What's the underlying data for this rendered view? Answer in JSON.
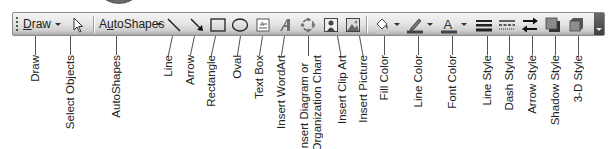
{
  "toolbar": {
    "draw_menu": {
      "label": "Draw",
      "accel": "D",
      "rest": "raw"
    },
    "autoshapes_menu": {
      "label": "AutoShapes",
      "pre": "A",
      "accel": "u",
      "rest": "toShapes"
    },
    "buttons": [
      {
        "id": "select-objects",
        "icon": "pointer-icon"
      },
      {
        "id": "line",
        "icon": "line-icon"
      },
      {
        "id": "arrow",
        "icon": "arrow-icon"
      },
      {
        "id": "rectangle",
        "icon": "rectangle-icon"
      },
      {
        "id": "oval",
        "icon": "oval-icon"
      },
      {
        "id": "text-box",
        "icon": "text-box-icon"
      },
      {
        "id": "insert-wordart",
        "icon": "wordart-icon"
      },
      {
        "id": "insert-diagram",
        "icon": "diagram-icon"
      },
      {
        "id": "insert-clip-art",
        "icon": "clip-art-icon"
      },
      {
        "id": "insert-picture",
        "icon": "picture-icon"
      },
      {
        "id": "fill-color",
        "icon": "paint-bucket-icon",
        "swatch": "#c8c8c8"
      },
      {
        "id": "line-color",
        "icon": "pen-icon",
        "swatch": "#444444"
      },
      {
        "id": "font-color",
        "icon": "font-color-icon",
        "swatch": "#444444"
      },
      {
        "id": "line-style",
        "icon": "line-style-icon"
      },
      {
        "id": "dash-style",
        "icon": "dash-style-icon"
      },
      {
        "id": "arrow-style",
        "icon": "arrow-style-icon"
      },
      {
        "id": "shadow-style",
        "icon": "shadow-style-icon"
      },
      {
        "id": "3d-style",
        "icon": "3d-style-icon"
      }
    ]
  },
  "callouts": [
    {
      "text": "Draw"
    },
    {
      "text": "Select Objects"
    },
    {
      "text": "AutoShapes"
    },
    {
      "text": "Line"
    },
    {
      "text": "Arrow"
    },
    {
      "text": "Rectangle"
    },
    {
      "text": "Oval"
    },
    {
      "text": "Text Box"
    },
    {
      "text": "Insert WordArt"
    },
    {
      "line1": "Insert Diagram or",
      "line2": "Organization Chart"
    },
    {
      "text": "Insert Clip Art"
    },
    {
      "text": "Insert Picture"
    },
    {
      "text": "Fill Color"
    },
    {
      "text": "Line Color"
    },
    {
      "text": "Font Color"
    },
    {
      "text": "Line Style"
    },
    {
      "text": "Dash Style"
    },
    {
      "text": "Arrow Style"
    },
    {
      "text": "Shadow Style"
    },
    {
      "text": "3-D Style"
    }
  ]
}
